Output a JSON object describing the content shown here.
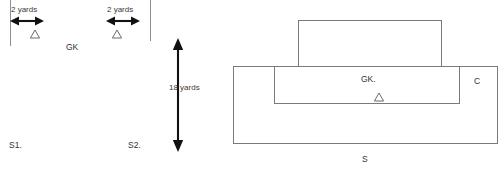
{
  "diagram": {
    "left_panel": {
      "measure_left": {
        "label": "2 yards",
        "unit": "yards",
        "value": 2
      },
      "measure_right": {
        "label": "2 yards",
        "unit": "yards",
        "value": 2
      },
      "markers": [
        {
          "id": "cone-left",
          "icon": "triangle-marker",
          "label": ""
        },
        {
          "id": "cone-right",
          "icon": "triangle-marker",
          "label": ""
        }
      ],
      "players": [
        {
          "id": "gk",
          "label": "GK"
        },
        {
          "id": "s1",
          "label": "S1."
        },
        {
          "id": "s2",
          "label": "S2."
        }
      ]
    },
    "middle_panel": {
      "measure_vertical": {
        "label": "18 yards",
        "unit": "yards",
        "value": 18
      }
    },
    "right_panel": {
      "players": [
        {
          "id": "gk",
          "label": "GK."
        },
        {
          "id": "c",
          "label": "C"
        },
        {
          "id": "s",
          "label": "S"
        }
      ],
      "markers": [
        {
          "id": "cone-center",
          "icon": "triangle-marker",
          "label": ""
        }
      ],
      "areas": [
        {
          "id": "goal",
          "label": ""
        },
        {
          "id": "six-yard-box",
          "label": ""
        },
        {
          "id": "penalty-area",
          "label": ""
        }
      ]
    }
  },
  "colors": {
    "line": "#8f8f8f",
    "arrow": "#111111",
    "text": "#3a3a3a",
    "background": "#ffffff"
  }
}
